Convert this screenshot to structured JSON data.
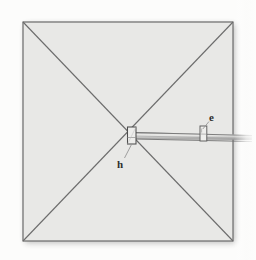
{
  "figure": {
    "background_color": "#fbfbfa",
    "panel_fill": "#e8e8e6",
    "line_color": "#6e6e6e",
    "dark_line_color": "#4a4a4a",
    "label_color": "#2b2b2b",
    "panel": {
      "name": "square-panel",
      "left": 23,
      "top": 22,
      "right": 233,
      "bottom": 241
    },
    "diagonals": [
      {
        "name": "diagonal-top-left-to-bottom-right",
        "x1": 23,
        "y1": 22,
        "x2": 233,
        "y2": 241
      },
      {
        "name": "diagonal-bottom-left-to-top-right",
        "x1": 23,
        "y1": 241,
        "x2": 233,
        "y2": 22
      }
    ],
    "center_block": {
      "name": "center-hub-block",
      "x": 127,
      "y": 127,
      "width": 9,
      "height": 17
    },
    "shaft": {
      "name": "horizontal-shaft",
      "x1": 136,
      "y1": 135,
      "x2": 250,
      "y2": 138,
      "thickness": 4
    },
    "clip": {
      "name": "shaft-clip",
      "x": 200,
      "y": 126,
      "width": 7,
      "height": 15
    },
    "labels": [
      {
        "name": "label-h",
        "text": "h",
        "x": 118,
        "y": 167,
        "leader": {
          "x1": 124,
          "y1": 158,
          "x2": 132,
          "y2": 144
        }
      },
      {
        "name": "label-e",
        "text": "e",
        "x": 210,
        "y": 120,
        "leader": {
          "x1": 209,
          "y1": 122,
          "x2": 203,
          "y2": 129
        }
      }
    ]
  }
}
